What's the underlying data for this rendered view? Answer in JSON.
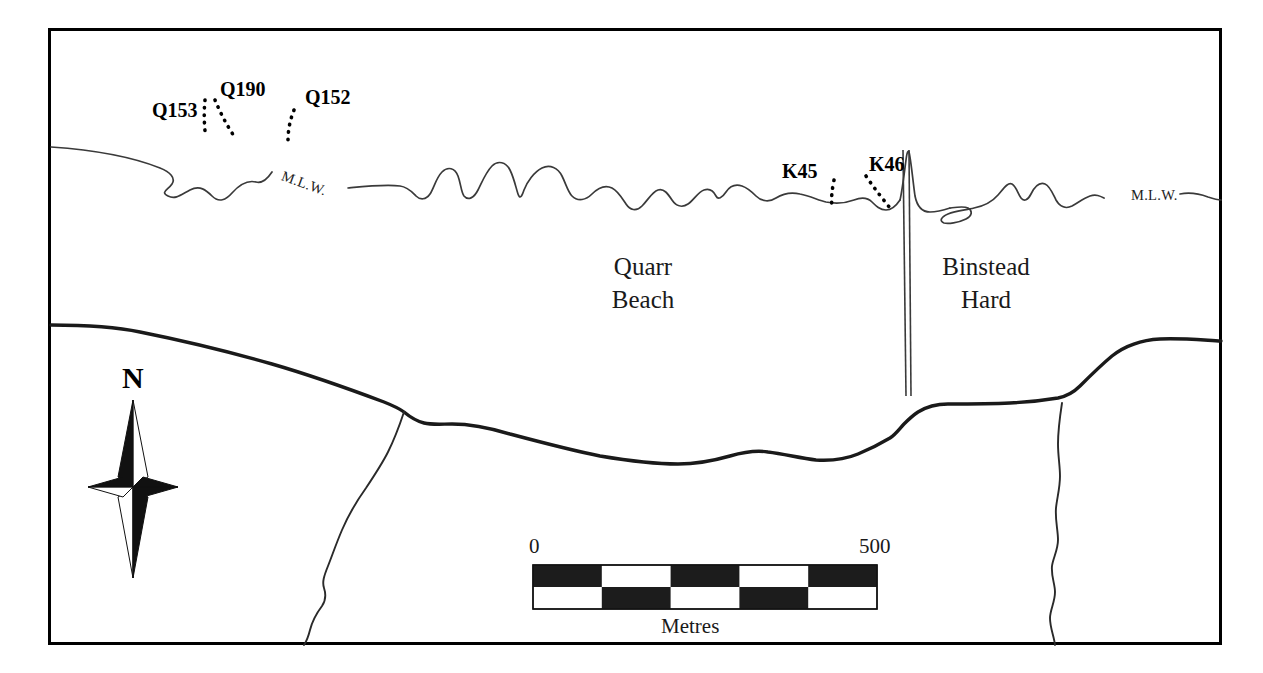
{
  "map": {
    "title": "Quarr Beach and Binstead Hard archaeological site plan",
    "frame": {
      "x": 48,
      "y": 28,
      "width": 1174,
      "height": 617,
      "stroke": "#000000",
      "stroke_width": 3
    },
    "colors": {
      "ink": "#000000",
      "coastline_thin": "#3a3a3a",
      "shore_thick": "#1a1a1a",
      "background": "#ffffff",
      "scalebar_fill": "#1c1c1c"
    },
    "place_labels": [
      {
        "name": "quarr-beach",
        "lines": [
          "Quarr",
          "Beach"
        ],
        "x": 638,
        "y": 248
      },
      {
        "name": "binstead-hard",
        "lines": [
          "Binstead",
          "Hard"
        ],
        "x": 981,
        "y": 248
      }
    ],
    "site_labels": [
      {
        "id": "Q153",
        "x": 152,
        "y": 110
      },
      {
        "id": "Q190",
        "x": 220,
        "y": 89
      },
      {
        "id": "Q152",
        "x": 305,
        "y": 97
      },
      {
        "id": "K45",
        "x": 782,
        "y": 171
      },
      {
        "id": "K46",
        "x": 869,
        "y": 164
      }
    ],
    "mlw_labels": [
      {
        "id": "mlw-left",
        "text": "M.L.W.",
        "x": 286,
        "y": 178,
        "rotated": true
      },
      {
        "id": "mlw-right",
        "text": "M.L.W.",
        "x": 1131,
        "y": 196,
        "rotated": false
      }
    ],
    "compass": {
      "label": "N",
      "label_x": 133,
      "label_y": 378,
      "center_x": 133,
      "center_y": 487
    },
    "scale_bar": {
      "min_label": "0",
      "max_label": "500",
      "unit_label": "Metres",
      "x": 533,
      "y": 565,
      "width": 344,
      "height": 44,
      "segments": 5,
      "rows": 2,
      "number_y": 534,
      "unit_y": 616
    },
    "legend_features": [
      {
        "name": "mean-low-water-line",
        "label": "M.L.W."
      },
      {
        "name": "high-water-shoreline"
      },
      {
        "name": "jetty-binstead-hard"
      },
      {
        "name": "field-boundary-west"
      },
      {
        "name": "field-boundary-east"
      }
    ]
  }
}
